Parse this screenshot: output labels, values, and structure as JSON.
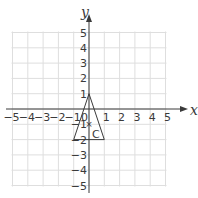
{
  "diagram": {
    "type": "coordinate-grid",
    "x_axis": {
      "label": "x",
      "min": -5,
      "max": 5,
      "ticks": [
        "-5",
        "-4",
        "-3",
        "-2",
        "-1",
        "1",
        "2",
        "3",
        "4",
        "5"
      ]
    },
    "y_axis": {
      "label": "y",
      "min": -5,
      "max": 5,
      "ticks": [
        "5",
        "4",
        "3",
        "2",
        "1",
        "-1",
        "-2",
        "-3",
        "-4",
        "-5"
      ]
    },
    "origin_label": "0",
    "triangle": {
      "vertices": [
        [
          0,
          1
        ],
        [
          -1,
          -2
        ],
        [
          1,
          -2
        ]
      ],
      "stroke": "#3a3a3a"
    },
    "point": {
      "label": "C",
      "x": 0,
      "y": -1,
      "marker": "×"
    },
    "colors": {
      "grid": "#dddddd",
      "axis": "#3a3a3a"
    }
  }
}
